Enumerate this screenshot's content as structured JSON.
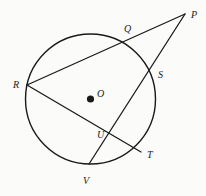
{
  "figure": {
    "kind": "circle-geometry-diagram",
    "width": 206,
    "height": 196,
    "background_color": "#fbfbfa",
    "stroke_color": "#1a1a1a",
    "label_color": "#1a1a1a"
  },
  "circle": {
    "name": "main-circle",
    "center_label": "O",
    "cx": 90.5,
    "cy": 99,
    "r": 65,
    "stroke_width": 1.3
  },
  "center_dot": {
    "cx": 90.5,
    "cy": 99,
    "r": 3.6
  },
  "points": {
    "P": {
      "label": "P",
      "x": 185,
      "y": 14,
      "label_x": 191,
      "label_y": 10
    },
    "Q": {
      "label": "Q",
      "x": 130,
      "y": 40,
      "label_x": 124,
      "label_y": 24
    },
    "R": {
      "label": "R",
      "x": 27,
      "y": 85,
      "label_x": 13,
      "label_y": 80
    },
    "S": {
      "label": "S",
      "x": 152,
      "y": 74,
      "label_x": 158,
      "label_y": 70
    },
    "T": {
      "label": "T",
      "x": 141,
      "y": 152,
      "label_x": 147,
      "label_y": 150
    },
    "U": {
      "label": "U",
      "x": 113,
      "y": 138,
      "label_x": 97,
      "label_y": 130
    },
    "V": {
      "label": "V",
      "x": 89,
      "y": 164,
      "label_x": 83,
      "label_y": 176
    },
    "O": {
      "label": "O",
      "x": 90.5,
      "y": 99,
      "label_x": 97,
      "label_y": 89
    }
  },
  "segments": [
    {
      "name": "secant-P-Q-R",
      "from": "P",
      "to": "R",
      "through": [
        "Q"
      ],
      "x1": 185,
      "y1": 14,
      "x2": 27,
      "y2": 85
    },
    {
      "name": "secant-P-S-V",
      "from": "P",
      "to": "V",
      "through": [
        "S",
        "U"
      ],
      "x1": 185,
      "y1": 14,
      "x2": 89,
      "y2": 164
    },
    {
      "name": "chord-R-T",
      "from": "R",
      "to": "T",
      "through": [
        "U"
      ],
      "x1": 27,
      "y1": 85,
      "x2": 141,
      "y2": 152
    }
  ],
  "labels_order": [
    "P",
    "Q",
    "R",
    "S",
    "T",
    "U",
    "V",
    "O"
  ]
}
